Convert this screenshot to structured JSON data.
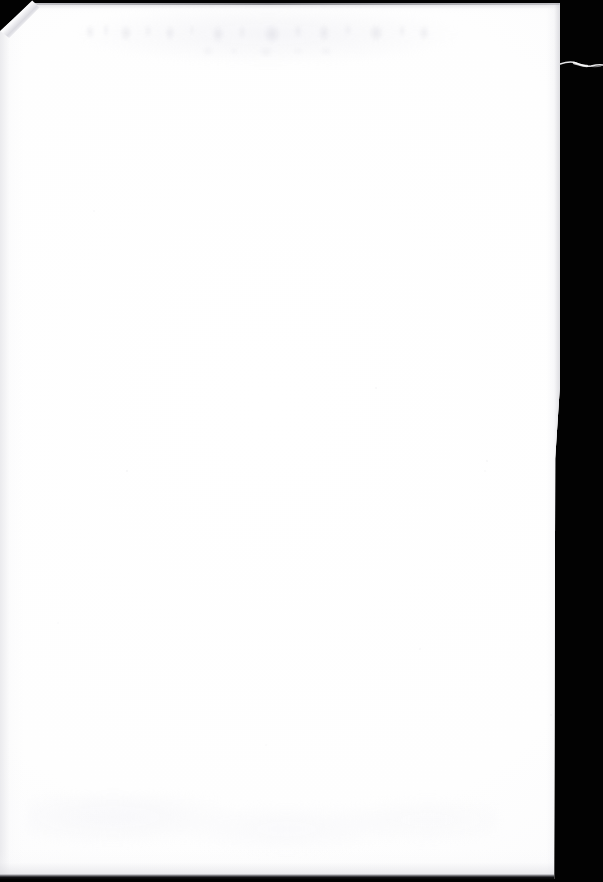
{
  "document": {
    "kind": "scanned-page",
    "page_side": "verso",
    "content_text": "",
    "caption": "Blank scanned page with black scanner background, dog-eared top-left corner and faint show-through from the reverse side.",
    "dimensions": {
      "width_px": 603,
      "height_px": 882
    }
  },
  "colors": {
    "scanner_background": "#020202",
    "paper_white": "#ffffff",
    "paper_shadow": "#f6f6f8",
    "edge_grey": "#cecdd4",
    "scan_line": "#111114",
    "fiber_white": "#f2f2f4"
  },
  "artifacts": {
    "folded_corner": {
      "name": "dog-eared-corner",
      "position": "top-left",
      "width_px": 40,
      "height_px": 36
    },
    "fiber_wisp": {
      "name": "paper-fiber-wisp",
      "position": "right-edge",
      "top_px": 60,
      "length_px": 43
    },
    "show_through": {
      "name": "reverse-side-bleed",
      "position": "top-band",
      "left_px": 84,
      "top_px": 14,
      "width_px": 350,
      "height_px": 30
    },
    "bottom_scan_line": {
      "name": "scan-edge-line",
      "position": "bottom",
      "height_px": 4
    }
  },
  "page_geometry": {
    "sheet_left_px": -2,
    "sheet_top_px": 3,
    "sheet_width_px": 564,
    "sheet_height_px": 876,
    "right_edge_x_px": 562
  }
}
